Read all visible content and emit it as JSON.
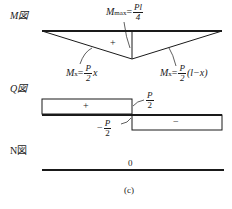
{
  "diagrams": {
    "moment": {
      "title": "M図",
      "max_label_prefix": "M",
      "max_label_sub": "max",
      "max_label_eq": "=",
      "max_num": "Pl",
      "max_den": "4",
      "sign": "+",
      "left_eq_prefix": "M",
      "left_eq_sub": "x",
      "left_eq_eq": "=",
      "left_num": "P",
      "left_den": "2",
      "left_tail": "x",
      "right_eq_prefix": "M",
      "right_eq_sub": "x",
      "right_eq_eq": "=",
      "right_num": "P",
      "right_den": "2",
      "right_tail": "(l−x)"
    },
    "shear": {
      "title": "Q図",
      "positive_sign": "+",
      "negative_sign": "−",
      "pos_num": "P",
      "pos_den": "2",
      "neg_prefix": "−",
      "neg_num": "P",
      "neg_den": "2"
    },
    "axial": {
      "title": "N図",
      "value": "0"
    }
  },
  "caption": "(c)",
  "colors": {
    "line": "#1a1a1a",
    "background": "#ffffff"
  }
}
